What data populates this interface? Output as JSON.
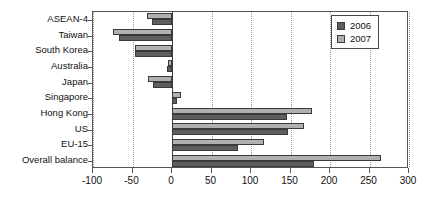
{
  "chart_data": {
    "type": "bar",
    "orientation": "horizontal",
    "title": "",
    "xlabel": "",
    "ylabel": "",
    "xlim": [
      -100,
      300
    ],
    "xticks": [
      -100,
      -50,
      0,
      50,
      100,
      150,
      200,
      250,
      300
    ],
    "xtick_labels": [
      "-100",
      "-50",
      "0",
      "50",
      "100",
      "150",
      "200",
      "250",
      "300"
    ],
    "grid": "vertical-dotted",
    "legend_position": "top-right",
    "categories": [
      "ASEAN-4",
      "Taiwan",
      "South Korea",
      "Australia",
      "Japan",
      "Singapore",
      "Hong Kong",
      "US",
      "EU-15",
      "Overall balance"
    ],
    "series": [
      {
        "name": "2006",
        "color": "#5e5e5e",
        "values": [
          -25,
          -67,
          -47,
          -6,
          -24,
          6,
          146,
          147,
          83,
          180
        ]
      },
      {
        "name": "2007",
        "color": "#b0b0b0",
        "values": [
          -32,
          -75,
          -47,
          -5,
          -30,
          11,
          177,
          167,
          117,
          264
        ]
      }
    ]
  },
  "legend": {
    "entries": [
      {
        "label": "2006",
        "color": "#5e5e5e"
      },
      {
        "label": "2007",
        "color": "#b0b0b0"
      }
    ]
  }
}
